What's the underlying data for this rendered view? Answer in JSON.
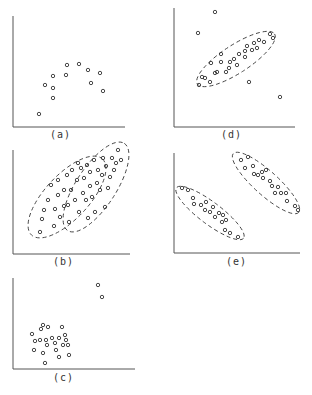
{
  "figure": {
    "panels": [
      {
        "id": "a",
        "label": "(a)",
        "axes": {
          "x0": 13,
          "y0": 127,
          "x1": 125,
          "ytop": 16
        },
        "label_pos": [
          50,
          129
        ],
        "points": [
          [
            39,
            114
          ],
          [
            45,
            85
          ],
          [
            53,
            76
          ],
          [
            53,
            88
          ],
          [
            53,
            98
          ],
          [
            66,
            75
          ],
          [
            67,
            65
          ],
          [
            79,
            64
          ],
          [
            88,
            70
          ],
          [
            91,
            83
          ],
          [
            100,
            73
          ],
          [
            103,
            91
          ]
        ],
        "ellipses": []
      },
      {
        "id": "d",
        "label": "(d)",
        "axes": {
          "x0": 174,
          "y0": 127,
          "x1": 295,
          "ytop": 8
        },
        "label_pos": [
          221,
          129
        ],
        "points": [
          [
            215,
            12
          ],
          [
            198,
            33
          ],
          [
            249,
            82
          ],
          [
            280,
            97
          ],
          [
            199,
            85
          ],
          [
            202,
            77
          ],
          [
            205,
            78
          ],
          [
            210,
            82
          ],
          [
            215,
            73
          ],
          [
            211,
            63
          ],
          [
            217,
            72
          ],
          [
            221,
            62
          ],
          [
            226,
            72
          ],
          [
            221,
            54
          ],
          [
            229,
            68
          ],
          [
            230,
            62
          ],
          [
            234,
            59
          ],
          [
            239,
            54
          ],
          [
            237,
            65
          ],
          [
            245,
            57
          ],
          [
            245,
            51
          ],
          [
            247,
            46
          ],
          [
            252,
            50
          ],
          [
            254,
            43
          ],
          [
            257,
            48
          ],
          [
            259,
            40
          ],
          [
            264,
            42
          ],
          [
            270,
            34
          ],
          [
            273,
            38
          ]
        ],
        "ellipses": [
          {
            "cx": 236,
            "cy": 59,
            "rx": 46,
            "ry": 14,
            "rot": -33
          }
        ]
      },
      {
        "id": "b",
        "label": "(b)",
        "axes": {
          "x0": 13,
          "y0": 254,
          "x1": 130,
          "ytop": 150
        },
        "label_pos": [
          53,
          256
        ],
        "points": [
          [
            40,
            232
          ],
          [
            42,
            219
          ],
          [
            44,
            210
          ],
          [
            48,
            200
          ],
          [
            51,
            185
          ],
          [
            54,
            226
          ],
          [
            55,
            209
          ],
          [
            58,
            195
          ],
          [
            58,
            180
          ],
          [
            60,
            217
          ],
          [
            64,
            206
          ],
          [
            64,
            190
          ],
          [
            67,
            175
          ],
          [
            68,
            205
          ],
          [
            69,
            222
          ],
          [
            71,
            190
          ],
          [
            72,
            170
          ],
          [
            75,
            200
          ],
          [
            77,
            180
          ],
          [
            78,
            163
          ],
          [
            79,
            212
          ],
          [
            81,
            168
          ],
          [
            83,
            193
          ],
          [
            84,
            178
          ],
          [
            86,
            200
          ],
          [
            87,
            165
          ],
          [
            88,
            218
          ],
          [
            90,
            186
          ],
          [
            90,
            172
          ],
          [
            92,
            197
          ],
          [
            94,
            160
          ],
          [
            95,
            212
          ],
          [
            97,
            183
          ],
          [
            98,
            170
          ],
          [
            100,
            190
          ],
          [
            102,
            175
          ],
          [
            103,
            158
          ],
          [
            105,
            207
          ],
          [
            106,
            166
          ],
          [
            108,
            188
          ],
          [
            110,
            177
          ],
          [
            112,
            158
          ],
          [
            114,
            170
          ],
          [
            116,
            163
          ],
          [
            118,
            150
          ],
          [
            121,
            160
          ]
        ],
        "ellipses": [
          {
            "cx": 67,
            "cy": 197,
            "rx": 52,
            "ry": 22,
            "rot": -47
          },
          {
            "cx": 96,
            "cy": 187,
            "rx": 52,
            "ry": 20,
            "rot": -57
          }
        ]
      },
      {
        "id": "e",
        "label": "(e)",
        "axes": {
          "x0": 174,
          "y0": 253,
          "x1": 300,
          "ytop": 153
        },
        "label_pos": [
          226,
          256
        ],
        "points": [
          [
            182,
            188
          ],
          [
            188,
            190
          ],
          [
            193,
            198
          ],
          [
            194,
            204
          ],
          [
            201,
            205
          ],
          [
            205,
            210
          ],
          [
            206,
            202
          ],
          [
            210,
            212
          ],
          [
            213,
            207
          ],
          [
            215,
            217
          ],
          [
            219,
            213
          ],
          [
            222,
            222
          ],
          [
            223,
            215
          ],
          [
            225,
            230
          ],
          [
            226,
            220
          ],
          [
            230,
            233
          ],
          [
            238,
            237
          ],
          [
            241,
            160
          ],
          [
            248,
            157
          ],
          [
            245,
            168
          ],
          [
            253,
            166
          ],
          [
            254,
            174
          ],
          [
            258,
            175
          ],
          [
            262,
            172
          ],
          [
            263,
            178
          ],
          [
            266,
            170
          ],
          [
            272,
            186
          ],
          [
            270,
            181
          ],
          [
            275,
            193
          ],
          [
            278,
            187
          ],
          [
            281,
            193
          ],
          [
            286,
            193
          ],
          [
            287,
            201
          ],
          [
            295,
            206
          ],
          [
            298,
            210
          ]
        ],
        "ellipses": [
          {
            "cx": 210,
            "cy": 213,
            "rx": 42,
            "ry": 11,
            "rot": 37
          },
          {
            "cx": 266,
            "cy": 183,
            "rx": 44,
            "ry": 12,
            "rot": 42
          }
        ]
      },
      {
        "id": "c",
        "label": "(c)",
        "axes": {
          "x0": 13,
          "y0": 369,
          "x1": 135,
          "ytop": 278
        },
        "label_pos": [
          53,
          372
        ],
        "points": [
          [
            98,
            285
          ],
          [
            102,
            297
          ],
          [
            32,
            334
          ],
          [
            35,
            341
          ],
          [
            34,
            350
          ],
          [
            40,
            340
          ],
          [
            41,
            329
          ],
          [
            43,
            353
          ],
          [
            43,
            325
          ],
          [
            45,
            363
          ],
          [
            46,
            340
          ],
          [
            47,
            345
          ],
          [
            48,
            327
          ],
          [
            52,
            338
          ],
          [
            55,
            343
          ],
          [
            56,
            350
          ],
          [
            59,
            338
          ],
          [
            59,
            357
          ],
          [
            62,
            327
          ],
          [
            63,
            345
          ],
          [
            65,
            335
          ],
          [
            66,
            340
          ],
          [
            68,
            345
          ],
          [
            69,
            355
          ]
        ],
        "ellipses": []
      }
    ]
  }
}
